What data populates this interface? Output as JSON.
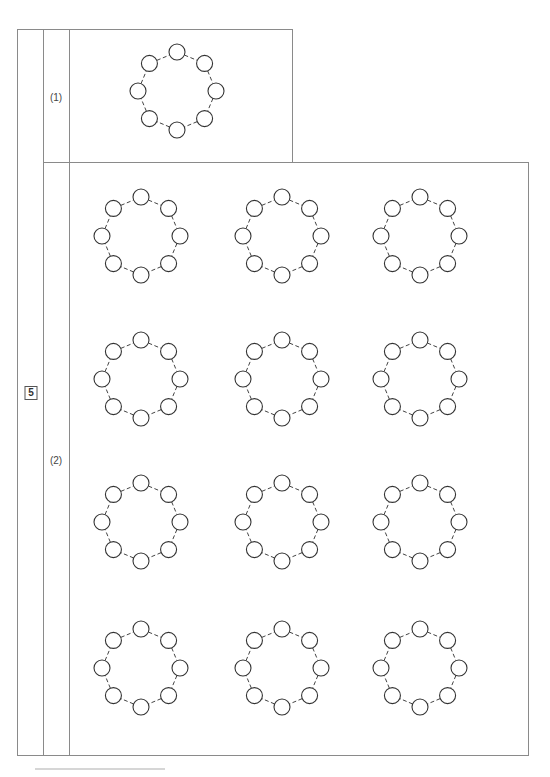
{
  "question_number": "5",
  "parts": [
    {
      "label": "(1)",
      "rings": [
        {
          "nodes": 8,
          "style": "dashed-ring"
        }
      ]
    },
    {
      "label": "(2)",
      "grid": {
        "rows": 4,
        "cols": 3
      },
      "rings": [
        {
          "nodes": 8
        },
        {
          "nodes": 8
        },
        {
          "nodes": 8
        },
        {
          "nodes": 8
        },
        {
          "nodes": 8
        },
        {
          "nodes": 8
        },
        {
          "nodes": 8
        },
        {
          "nodes": 8
        },
        {
          "nodes": 8
        },
        {
          "nodes": 8
        },
        {
          "nodes": 8
        },
        {
          "nodes": 8
        }
      ]
    }
  ],
  "colors": {
    "border": "#8a8a8a",
    "ink": "#333333"
  }
}
